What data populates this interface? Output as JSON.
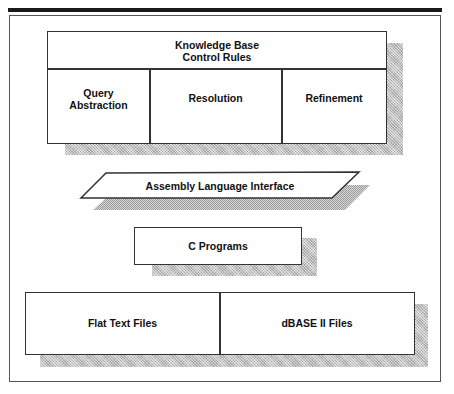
{
  "diagram": {
    "knowledge_base": {
      "title_line1": "Knowledge Base",
      "title_line2": "Control Rules",
      "columns": [
        {
          "line1": "Query",
          "line2": "Abstraction"
        },
        {
          "label": "Resolution"
        },
        {
          "label": "Refinement"
        }
      ]
    },
    "assembly_interface": {
      "label": "Assembly Language Interface"
    },
    "c_programs": {
      "label": "C Programs"
    },
    "files": [
      {
        "label": "Flat Text Files"
      },
      {
        "label": "dBASE II Files"
      }
    ]
  }
}
